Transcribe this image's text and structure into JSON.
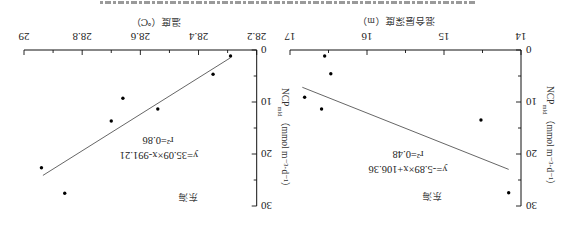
{
  "figure": {
    "orientation": "rotated 180°",
    "colors": {
      "axis": "#111111",
      "fit_line": "#555555",
      "points": "#000000",
      "text": "#222222"
    }
  },
  "chart_data": [
    {
      "type": "scatter",
      "panel": "mld",
      "title": "",
      "region_label": "东海",
      "xlabel": "混合层深度（m）",
      "ylabel": {
        "main": "NCP",
        "sub": "mld",
        "units": "（mmol m⁻³·d⁻¹）"
      },
      "xlim": [
        14,
        17
      ],
      "ylim": [
        0,
        30
      ],
      "xticks": [
        14,
        15,
        16,
        17
      ],
      "xtick_labels": [
        "14",
        "15",
        "16",
        "17"
      ],
      "x_minor_step": 0.5,
      "yticks": [
        0,
        10,
        20,
        30
      ],
      "ytick_labels": [
        "0",
        "10",
        "20",
        "30"
      ],
      "y_minor_step": 5,
      "grid": false,
      "legend": "none",
      "points": [
        {
          "x": 16.55,
          "y": 1.15
        },
        {
          "x": 16.47,
          "y": 4.56
        },
        {
          "x": 16.81,
          "y": 9.1
        },
        {
          "x": 16.59,
          "y": 11.35
        },
        {
          "x": 14.52,
          "y": 13.46
        },
        {
          "x": 14.16,
          "y": 27.44
        }
      ],
      "fit": {
        "equation": "y=-5.89×x+106.36",
        "r2_label": "r²=0.48",
        "slope": -5.89,
        "intercept": 106.36,
        "x_range": [
          14.16,
          16.84
        ]
      }
    },
    {
      "type": "scatter",
      "panel": "temperature",
      "title": "",
      "region_label": "东海",
      "xlabel": "温度（℃）",
      "ylabel": {
        "main": "NCP",
        "sub": "mld",
        "units": "（mmol m⁻³·d⁻¹）"
      },
      "xlim": [
        28.2,
        29.0
      ],
      "ylim": [
        0,
        30
      ],
      "xticks": [
        28.2,
        28.4,
        28.6,
        28.8,
        29.0
      ],
      "xtick_labels": [
        "28.2",
        "28.4",
        "28.6",
        "28.8",
        "29"
      ],
      "x_minor_step": 0.1,
      "yticks": [
        0,
        10,
        20,
        30
      ],
      "ytick_labels": [
        "0",
        "10",
        "20",
        "30"
      ],
      "y_minor_step": 5,
      "grid": false,
      "legend": "none",
      "points": [
        {
          "x": 28.29,
          "y": 1.15
        },
        {
          "x": 28.35,
          "y": 4.67
        },
        {
          "x": 28.66,
          "y": 9.29
        },
        {
          "x": 28.54,
          "y": 11.35
        },
        {
          "x": 28.7,
          "y": 13.65
        },
        {
          "x": 28.94,
          "y": 22.63
        },
        {
          "x": 28.86,
          "y": 27.56
        }
      ],
      "fit": {
        "equation": "y=35.09×x-991.21",
        "r2_label": "r²=0.86",
        "slope": 35.09,
        "intercept": -991.21,
        "x_range": [
          28.29,
          28.935
        ]
      }
    }
  ]
}
